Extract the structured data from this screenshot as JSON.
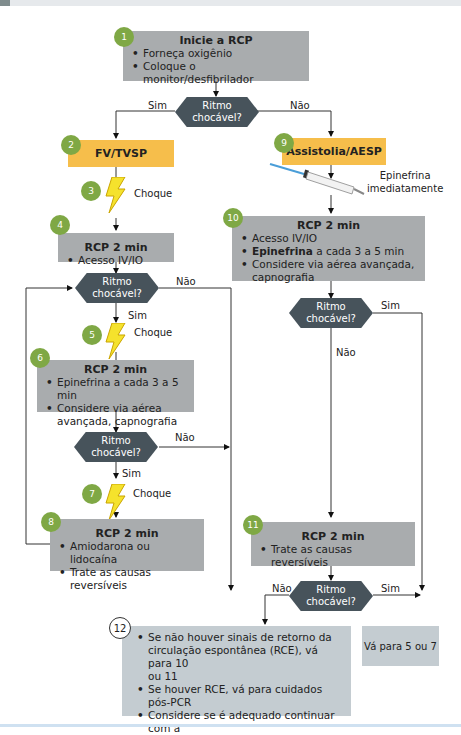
{
  "decision_label": [
    "Ritmo",
    "chocável?"
  ],
  "yes": "Sim",
  "no": "Não",
  "shock": "Choque",
  "steps": {
    "s1": {
      "num": "1",
      "title": "Inicie a RCP",
      "items": [
        "Forneça oxigênio",
        "Coloque o monitor/desfibrilador"
      ]
    },
    "s2": {
      "num": "2",
      "title": "FV/TVSP"
    },
    "s3": {
      "num": "3"
    },
    "s4": {
      "num": "4",
      "title": "RCP 2 min",
      "items": [
        "Acesso IV/IO"
      ]
    },
    "s5": {
      "num": "5"
    },
    "s6": {
      "num": "6",
      "title": "RCP 2 min",
      "items": [
        "Epinefrina a cada 3 a 5 min",
        "Considere via aérea",
        "avançada, capnografia"
      ]
    },
    "s7": {
      "num": "7"
    },
    "s8": {
      "num": "8",
      "title": "RCP 2 min",
      "items": [
        "Amiodarona ou lidocaína",
        "Trate as causas reversíveis"
      ]
    },
    "s9": {
      "num": "9",
      "title": "Assistolia/AESP"
    },
    "epi": {
      "line1": "Epinefrina",
      "line2": "imediatamente"
    },
    "s10": {
      "num": "10",
      "title": "RCP 2 min",
      "items": [
        "Acesso IV/IO",
        "Epinefrina",
        " a cada 3 a 5 min",
        "Considere via aérea avançada,",
        "capnografia"
      ]
    },
    "s11": {
      "num": "11",
      "title": "RCP 2 min",
      "items": [
        "Trate as causas reversíveis"
      ]
    },
    "s12": {
      "num": "12",
      "items": [
        "Se não houver sinais de retorno da",
        "circulação espontânea (RCE), vá para 10",
        "ou 11",
        "Se houver RCE, vá para cuidados pós-PCR",
        "Considere se é adequado continuar com a",
        "ressuscitação"
      ]
    },
    "goto": {
      "text": "Vá para 5 ou 7"
    }
  },
  "colors": {
    "grey_box": "#a9acae",
    "yellow_box": "#f6be4b",
    "decision": "#47535b",
    "badge": "#7fa845",
    "light_box": "#c4ccd1"
  }
}
